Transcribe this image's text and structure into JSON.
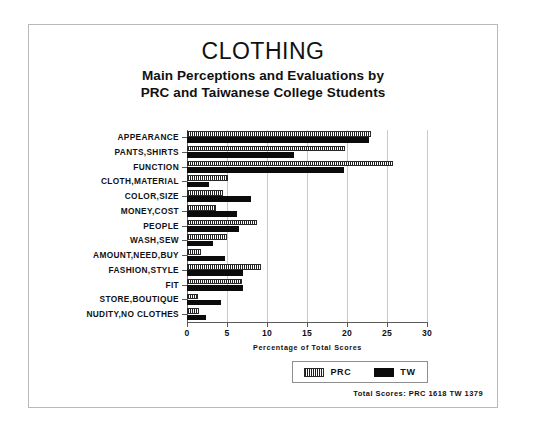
{
  "chart_data": {
    "type": "bar",
    "orientation": "horizontal",
    "title": "CLOTHING",
    "subtitle_line1": "Main Perceptions and Evaluations by",
    "subtitle_line2": "PRC and Taiwanese College Students",
    "xlabel": "Percentage of Total Scores",
    "ylabel": "",
    "xlim": [
      0,
      30
    ],
    "xticks": [
      0,
      5,
      10,
      15,
      20,
      25,
      30
    ],
    "xtick_labels": [
      "0",
      "5",
      "10",
      "15",
      "20",
      "25",
      "30"
    ],
    "grid": true,
    "grid_axis": "x",
    "legend_position": "bottom-right",
    "categories": [
      "APPEARANCE",
      "PANTS,SHIRTS",
      "FUNCTION",
      "CLOTH,MATERIAL",
      "COLOR,SIZE",
      "MONEY,COST",
      "PEOPLE",
      "WASH,SEW",
      "AMOUNT,NEED,BUY",
      "FASHION,STYLE",
      "FIT",
      "STORE,BOUTIQUE",
      "NUDITY,NO CLOTHES"
    ],
    "series": [
      {
        "name": "PRC",
        "pattern": "hatched",
        "color": "#ffffff",
        "edge_color": "#1f1f1f",
        "values": [
          23.0,
          19.8,
          25.8,
          5.1,
          4.5,
          3.6,
          8.8,
          5.0,
          1.8,
          9.3,
          6.9,
          1.4,
          1.5
        ]
      },
      {
        "name": "TW",
        "pattern": "solid",
        "color": "#0b0b0b",
        "edge_color": "#0b0b0b",
        "values": [
          22.8,
          13.4,
          19.6,
          2.8,
          8.0,
          6.2,
          6.5,
          3.2,
          4.8,
          7.0,
          7.0,
          4.3,
          2.4
        ]
      }
    ],
    "annotations": {
      "totals": "Total Scores:  PRC 1618   TW 1379"
    }
  },
  "legend": {
    "items": [
      {
        "label": "PRC",
        "swatch": "hatched"
      },
      {
        "label": "TW",
        "swatch": "solid"
      }
    ]
  }
}
